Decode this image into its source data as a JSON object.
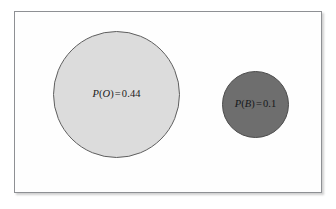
{
  "figure": {
    "type": "venn-probability-diagram",
    "background_color": "#ffffff",
    "frame": {
      "border_color": "#8e9094",
      "fill_color": "#fefefe"
    }
  },
  "regions": [
    {
      "id": "O",
      "name": "outcome-o-region",
      "fill_color": "#dcdcdc",
      "stroke_color": "#5f5f5f",
      "label": {
        "function": "P",
        "open_paren": "(",
        "variable": "O",
        "close_paren": ")",
        "equals": "=",
        "value": "0.44",
        "full_text": "P(O) = 0.44"
      }
    },
    {
      "id": "B",
      "name": "outcome-b-region",
      "fill_color": "#6e6e6e",
      "stroke_color": "#4c4c4c",
      "label": {
        "function": "P",
        "open_paren": "(",
        "variable": "B",
        "close_paren": ")",
        "equals": "=",
        "value": "0.1",
        "full_text": "P(B) = 0.1"
      }
    }
  ],
  "chart_data": {
    "type": "pie",
    "title": "",
    "categories": [
      "O",
      "B"
    ],
    "values": [
      0.44,
      0.1
    ],
    "labels": [
      "P(O) = 0.44",
      "P(B) = 0.1"
    ],
    "colors": [
      "#dcdcdc",
      "#6e6e6e"
    ],
    "legend": "none",
    "grid": false
  }
}
